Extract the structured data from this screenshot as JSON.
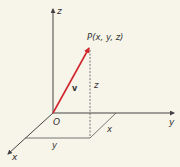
{
  "diagram": {
    "type": "3d-coordinate-vector",
    "colors": {
      "background": "#f7f4ea",
      "axis": "#444444",
      "vector": "#d0262e",
      "text": "#333333"
    },
    "axes": {
      "x_label": "x",
      "y_label": "y",
      "z_label": "z"
    },
    "origin_label": "O",
    "point_label": "P(x, y, z)",
    "vector_label": "v",
    "dimension_labels": {
      "z_height": "z",
      "x_length": "x",
      "y_length": "y"
    }
  }
}
